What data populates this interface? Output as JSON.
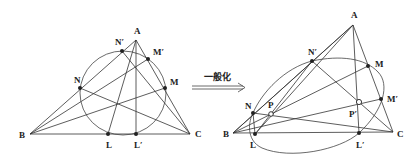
{
  "arrow": {
    "label": "一般化"
  },
  "left_figure": {
    "labels": {
      "A": "A",
      "B": "B",
      "C": "C",
      "N": "N",
      "N_prime": "N′",
      "M": "M",
      "M_prime": "M′",
      "L": "L",
      "L_prime": "L′"
    }
  },
  "right_figure": {
    "labels": {
      "A": "A",
      "B": "B",
      "C": "C",
      "N": "N",
      "N_prime": "N′",
      "M": "M",
      "M_prime": "M′",
      "L": "L",
      "L_prime": "L′",
      "P": "P",
      "P_prime": "P′"
    }
  }
}
